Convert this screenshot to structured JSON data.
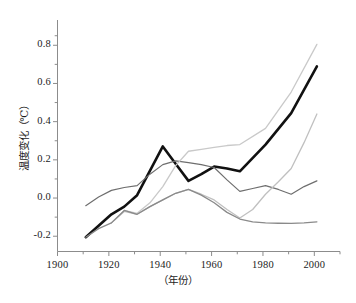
{
  "chart_data": {
    "type": "line",
    "title": "",
    "xlabel": "（年份）",
    "ylabel": "温度变化（℃）",
    "xlim": [
      1900,
      2010
    ],
    "ylim": [
      -0.28,
      0.88
    ],
    "grid": false,
    "legend": "none",
    "x_ticks": [
      "1900",
      "1920",
      "1940",
      "1960",
      "1980",
      "2000"
    ],
    "x_tick_values": [
      1900,
      1920,
      1940,
      1960,
      1980,
      2000
    ],
    "y_ticks": [
      "0.8",
      "0.6",
      "0.4",
      "0.2",
      "0.0",
      "-0.2"
    ],
    "y_tick_values": [
      0.8,
      0.6,
      0.4,
      0.2,
      0.0,
      -0.2
    ],
    "y_minor_tick_values": [
      0.7,
      0.5,
      0.3,
      0.1,
      -0.1,
      0.85
    ],
    "x_minor_tick_values": [
      1910,
      1930,
      1950,
      1970,
      1990,
      2010
    ],
    "series": [
      {
        "name": "observed-bold-black",
        "color": "#111111",
        "width": 2.6,
        "x": [
          1911,
          1921,
          1926,
          1931,
          1941,
          1946,
          1951,
          1956,
          1961,
          1966,
          1971,
          1981,
          1991,
          2001
        ],
        "values": [
          -0.205,
          -0.085,
          -0.045,
          0.015,
          0.27,
          0.18,
          0.09,
          0.125,
          0.165,
          0.155,
          0.14,
          0.28,
          0.445,
          0.69
        ]
      },
      {
        "name": "model-mid-gray-upper",
        "color": "#6e6e6e",
        "width": 1.2,
        "x": [
          1911,
          1916,
          1921,
          1926,
          1931,
          1936,
          1941,
          1946,
          1951,
          1956,
          1961,
          1966,
          1971,
          1976,
          1981,
          1986,
          1991,
          1996,
          2001
        ],
        "values": [
          -0.04,
          0.005,
          0.04,
          0.055,
          0.065,
          0.125,
          0.175,
          0.195,
          0.185,
          0.175,
          0.16,
          0.095,
          0.035,
          0.05,
          0.065,
          0.045,
          0.02,
          0.06,
          0.09
        ]
      },
      {
        "name": "scenario-light-gray-high",
        "color": "#c9c9c9",
        "width": 1.3,
        "x": [
          1921,
          1926,
          1931,
          1936,
          1941,
          1946,
          1951,
          1956,
          1961,
          1966,
          1971,
          1981,
          1991,
          2001
        ],
        "values": [
          -0.13,
          -0.065,
          -0.08,
          -0.025,
          0.06,
          0.17,
          0.245,
          0.255,
          0.265,
          0.275,
          0.28,
          0.365,
          0.555,
          0.805
        ]
      },
      {
        "name": "scenario-light-gray-mid",
        "color": "#c0c0c0",
        "width": 1.3,
        "x": [
          1921,
          1926,
          1931,
          1936,
          1941,
          1946,
          1951,
          1956,
          1961,
          1966,
          1971,
          1976,
          1981,
          1986,
          1991,
          1996,
          2001
        ],
        "values": [
          -0.13,
          -0.07,
          -0.085,
          -0.045,
          -0.01,
          0.025,
          0.045,
          0.02,
          -0.01,
          -0.06,
          -0.105,
          -0.06,
          0.02,
          0.085,
          0.155,
          0.29,
          0.44
        ]
      },
      {
        "name": "baseline-mid-gray-low",
        "color": "#8a8a8a",
        "width": 1.3,
        "x": [
          1911,
          1916,
          1921,
          1926,
          1931,
          1936,
          1941,
          1946,
          1951,
          1956,
          1961,
          1966,
          1971,
          1976,
          1981,
          1986,
          1991,
          1996,
          2001
        ],
        "values": [
          -0.205,
          -0.16,
          -0.13,
          -0.065,
          -0.085,
          -0.045,
          -0.01,
          0.025,
          0.045,
          0.015,
          -0.025,
          -0.075,
          -0.11,
          -0.125,
          -0.13,
          -0.132,
          -0.133,
          -0.13,
          -0.125
        ]
      }
    ]
  },
  "axes": {
    "axis_color": "#8c8c8c",
    "text_color": "#1c1c1c"
  }
}
